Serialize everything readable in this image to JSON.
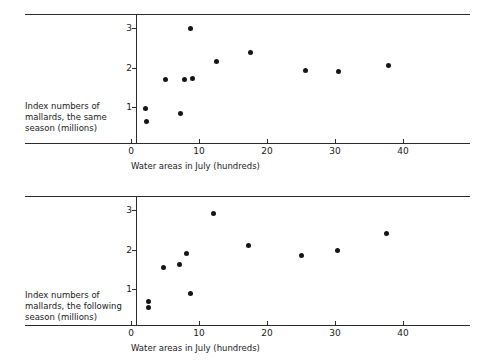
{
  "figure": {
    "background": "#ffffff",
    "dot_color": "#161616",
    "axis_color": "#2b2b2b"
  },
  "panels": [
    {
      "id": "top",
      "ylabel_lines": [
        "Index numbers of",
        "mallards, the same",
        "season (millions)"
      ],
      "xlabel": "Water areas in July (hundreds)",
      "xticks": [
        "0",
        "10",
        "20",
        "30",
        "40"
      ],
      "yticks": [
        "1",
        "2",
        "3"
      ]
    },
    {
      "id": "bottom",
      "ylabel_lines": [
        "Index numbers of",
        "mallards, the following",
        "season (millions)"
      ],
      "xlabel": "Water areas in July (hundreds)",
      "xticks": [
        "0",
        "10",
        "20",
        "30",
        "40"
      ],
      "yticks": [
        "1",
        "2",
        "3"
      ]
    }
  ],
  "chart_data": [
    {
      "type": "scatter",
      "title": "",
      "xlabel": "Water areas in July (hundreds)",
      "ylabel": "Index numbers of mallards, the same season (millions)",
      "xlim": [
        0,
        45
      ],
      "ylim": [
        0,
        3.3
      ],
      "xticks": [
        0,
        10,
        20,
        30,
        40
      ],
      "yticks": [
        1,
        2,
        3
      ],
      "grid": false,
      "legend": "none",
      "x": [
        2.1,
        2.2,
        5.1,
        7.3,
        7.8,
        8.8,
        9.1,
        12.6,
        17.6,
        25.6,
        30.5,
        37.8
      ],
      "y": [
        0.98,
        0.65,
        1.7,
        0.85,
        1.7,
        2.99,
        1.73,
        2.16,
        2.38,
        1.94,
        1.92,
        2.07
      ]
    },
    {
      "type": "scatter",
      "title": "",
      "xlabel": "Water areas in July (hundreds)",
      "ylabel": "Index numbers of mallards, the following season (millions)",
      "xlim": [
        0,
        45
      ],
      "ylim": [
        0,
        3.3
      ],
      "xticks": [
        0,
        10,
        20,
        30,
        40
      ],
      "yticks": [
        1,
        2,
        3
      ],
      "grid": false,
      "legend": "none",
      "x": [
        2.6,
        2.6,
        4.8,
        7.1,
        8.2,
        8.8,
        12.1,
        17.3,
        25.1,
        30.4,
        37.6
      ],
      "y": [
        0.7,
        0.53,
        1.55,
        1.64,
        1.92,
        0.9,
        2.92,
        2.12,
        1.85,
        1.98,
        2.42
      ]
    }
  ]
}
